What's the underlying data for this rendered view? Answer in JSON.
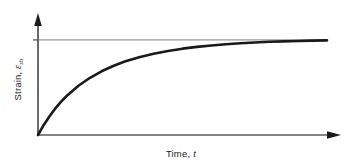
{
  "figure": {
    "background_color": "#ffffff",
    "curve_color": "#1a1a1a",
    "axis_color": "#4d4d4d",
    "asymptote_color": "#808080"
  },
  "axes": {
    "x": {
      "label_text": "Time,",
      "label_symbol": "t",
      "has_arrow": true
    },
    "y": {
      "label_text": "Strain,",
      "label_symbol": "ε",
      "label_subscript": "sh",
      "has_arrow": true,
      "has_tick_at_asymptote": true
    }
  },
  "chart_data": {
    "type": "line",
    "title": "",
    "xlabel": "Time, t",
    "ylabel": "Strain, εsh",
    "xlim": [
      0,
      1
    ],
    "ylim": [
      0,
      1.12
    ],
    "grid": false,
    "legend": null,
    "annotations": [
      {
        "name": "ultimate-shrinkage-asymptote",
        "type": "horizontal-line",
        "y": 1.0,
        "style": "thin-solid"
      }
    ],
    "series": [
      {
        "name": "shrinkage-strain",
        "style": "thick-solid",
        "x": [
          0.0,
          0.02,
          0.04,
          0.06,
          0.08,
          0.1,
          0.14,
          0.18,
          0.22,
          0.26,
          0.3,
          0.35,
          0.4,
          0.45,
          0.5,
          0.55,
          0.6,
          0.65,
          0.7,
          0.75,
          0.8,
          0.85,
          0.9,
          0.95,
          1.0
        ],
        "y": [
          0.0,
          0.106,
          0.198,
          0.279,
          0.35,
          0.413,
          0.518,
          0.602,
          0.67,
          0.726,
          0.772,
          0.818,
          0.855,
          0.884,
          0.908,
          0.927,
          0.942,
          0.955,
          0.965,
          0.973,
          0.98,
          0.985,
          0.989,
          0.992,
          0.995
        ]
      }
    ]
  }
}
